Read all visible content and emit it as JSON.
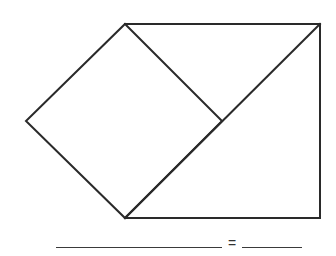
{
  "diagram": {
    "type": "geometry-worksheet",
    "stroke_color": "#2a2a2a",
    "stroke_width": 2,
    "vertices": {
      "top_left": [
        125,
        24
      ],
      "top_right": [
        320,
        24
      ],
      "bottom_right": [
        320,
        218
      ],
      "bottom_left": [
        125,
        218
      ],
      "left": [
        26,
        121
      ],
      "mid": [
        222,
        121
      ]
    },
    "shapes": [
      {
        "name": "square-on-diagonal",
        "points": [
          [
            125,
            24
          ],
          [
            222,
            121
          ],
          [
            125,
            218
          ],
          [
            26,
            121
          ]
        ]
      },
      {
        "name": "outer-rectangle",
        "points": [
          [
            125,
            24
          ],
          [
            320,
            24
          ],
          [
            320,
            218
          ],
          [
            125,
            218
          ]
        ]
      },
      {
        "name": "diagonal",
        "points": [
          [
            125,
            218
          ],
          [
            320,
            24
          ]
        ]
      }
    ]
  },
  "equation": {
    "left_blank": "",
    "operator": "=",
    "right_blank": ""
  }
}
